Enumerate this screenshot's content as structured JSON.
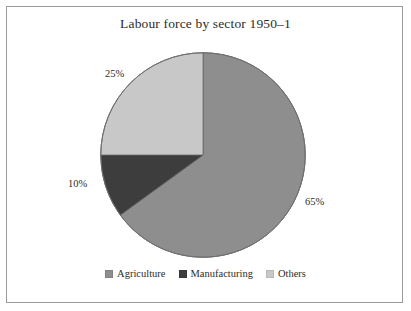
{
  "figure": {
    "title": "Labour force by sector 1950–1",
    "border_color": "#9a9a9a",
    "background_color": "#ffffff",
    "text_color": "#2c2c2c"
  },
  "legend": {
    "position": "bottom-center",
    "items": [
      {
        "label": "Agriculture",
        "color": "#8e8e8e",
        "swatch_name": "legend-swatch-agriculture"
      },
      {
        "label": "Manufacturing",
        "color": "#3d3d3d",
        "swatch_name": "legend-swatch-manufacturing"
      },
      {
        "label": "Others",
        "color": "#c8c8c8",
        "swatch_name": "legend-swatch-others"
      }
    ]
  },
  "labels": {
    "agriculture_pct": "65%",
    "manufacturing_pct": "10%",
    "others_pct": "25%"
  },
  "chart_data": {
    "type": "pie",
    "title": "Labour force by sector 1950–1",
    "subtitle": "",
    "xlabel": "",
    "ylabel": "",
    "unit": "percent",
    "start_angle_deg": 0,
    "direction": "clockwise",
    "grid": false,
    "legend_position": "bottom-center",
    "categories": [
      "Agriculture",
      "Manufacturing",
      "Others"
    ],
    "values": [
      65,
      10,
      25
    ],
    "data_labels": [
      "65%",
      "10%",
      "25%"
    ],
    "colors": [
      "#8e8e8e",
      "#3d3d3d",
      "#c8c8c8"
    ],
    "slices": [
      {
        "name": "Agriculture",
        "value": 65,
        "label": "65%",
        "color": "#8e8e8e",
        "start_deg": 0,
        "end_deg": 234
      },
      {
        "name": "Manufacturing",
        "value": 10,
        "label": "10%",
        "color": "#3d3d3d",
        "start_deg": 234,
        "end_deg": 270
      },
      {
        "name": "Others",
        "value": 25,
        "label": "25%",
        "color": "#c8c8c8",
        "start_deg": 270,
        "end_deg": 360
      }
    ]
  }
}
